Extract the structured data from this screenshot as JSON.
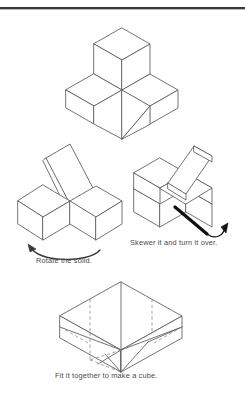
{
  "page": {
    "background_color": "#ffffff",
    "line_color": "#5a5a5a",
    "hidden_line_color": "#8d8d8d",
    "arrow_color": "#3a3a3a",
    "text_color": "#4a4a4a",
    "rule_color": "#3a3a3a"
  },
  "steps": [
    {
      "id": "step-1",
      "name": "solid-assembly",
      "caption": "",
      "description": "Isometric solid: a cube stacked on a rectangular slab with a slanted cut face"
    },
    {
      "id": "step-2",
      "name": "rotated-solid",
      "caption": "Rotate the solid.",
      "arrow": "curved-left-arrow",
      "description": "Two cubes side by side with a raised slanted plane"
    },
    {
      "id": "step-3",
      "name": "skewered-solid",
      "caption": "Skewer it and turn it over.",
      "arrow": "straight-diagonal-arrow",
      "description": "Block with a slanted wedge resting on top, skewer arrow through it"
    },
    {
      "id": "step-4",
      "name": "completed-cube",
      "caption": "Fit it together to make a cube.",
      "description": "Completed cube with dashed hidden interior edges"
    }
  ],
  "captions": {
    "rotate": "Rotate the solid.",
    "skewer": "Skewer it and turn it over.",
    "fit": "Fit it together to make a cube."
  }
}
